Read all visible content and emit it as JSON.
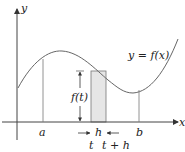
{
  "figure": {
    "axes": {
      "x_label": "x",
      "y_label": "y"
    },
    "curve_label": "y = f(x)",
    "height_label": "f(t)",
    "width_label": "h",
    "ticks": {
      "a": "a",
      "b": "b",
      "t": "t",
      "t_plus_h": "t + h"
    },
    "colors": {
      "line": "#555555",
      "rect_fill": "#e6e6e6",
      "axis": "#444444"
    }
  }
}
